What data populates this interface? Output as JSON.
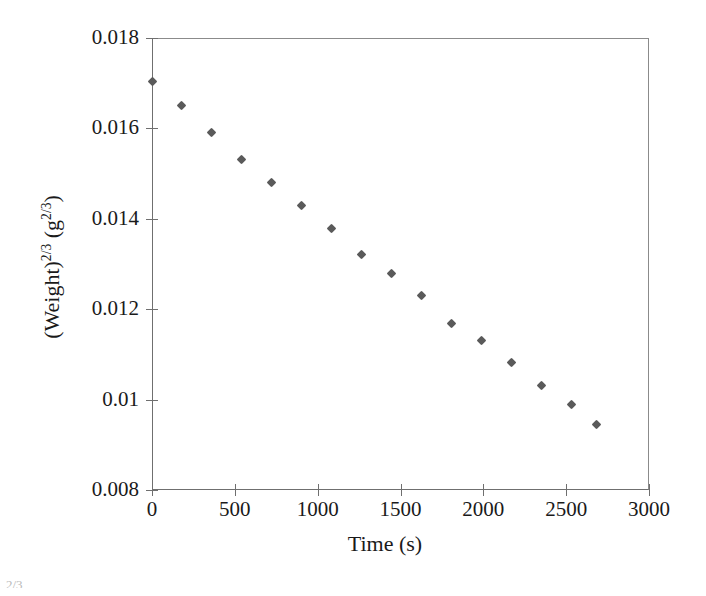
{
  "chart_data": {
    "type": "scatter",
    "title": "",
    "xlabel": "Time (s)",
    "ylabel": "(Weight)2/3 (g2/3)",
    "ylabel_parts": {
      "base1": "(Weight)",
      "exp1": "2/3",
      "mid": " (g",
      "exp2": "2/3",
      "tail": ")"
    },
    "xlim": [
      0,
      3000
    ],
    "ylim": [
      0.008,
      0.018
    ],
    "xticks": [
      0,
      500,
      1000,
      1500,
      2000,
      2500,
      3000
    ],
    "yticks": [
      0.008,
      0.01,
      0.012,
      0.014,
      0.016,
      0.018
    ],
    "xtick_labels": [
      "0",
      "500",
      "1000",
      "1500",
      "2000",
      "2500",
      "3000"
    ],
    "ytick_labels": [
      "0.008",
      "0.01",
      "0.012",
      "0.014",
      "0.016",
      "0.018"
    ],
    "grid": false,
    "legend": null,
    "marker": "diamond",
    "marker_color": "#5a5a5a",
    "frame_color": "#6f6f6f",
    "x": [
      0,
      181,
      362,
      543,
      724,
      905,
      1086,
      1267,
      1448,
      1629,
      1810,
      1991,
      2172,
      2353,
      2534,
      2685
    ],
    "y": [
      0.01703,
      0.01651,
      0.0159,
      0.01531,
      0.0148,
      0.01429,
      0.01379,
      0.01321,
      0.0128,
      0.0123,
      0.01169,
      0.0113,
      0.01081,
      0.01032,
      0.0099,
      0.00944
    ],
    "points": [
      {
        "x": 0,
        "y": 0.01703
      },
      {
        "x": 181,
        "y": 0.01651
      },
      {
        "x": 362,
        "y": 0.0159
      },
      {
        "x": 543,
        "y": 0.01531
      },
      {
        "x": 724,
        "y": 0.0148
      },
      {
        "x": 905,
        "y": 0.01429
      },
      {
        "x": 1086,
        "y": 0.01379
      },
      {
        "x": 1267,
        "y": 0.01321
      },
      {
        "x": 1448,
        "y": 0.0128
      },
      {
        "x": 1629,
        "y": 0.0123
      },
      {
        "x": 1810,
        "y": 0.01169
      },
      {
        "x": 1991,
        "y": 0.0113
      },
      {
        "x": 2172,
        "y": 0.01081
      },
      {
        "x": 2353,
        "y": 0.01032
      },
      {
        "x": 2534,
        "y": 0.0099
      },
      {
        "x": 2685,
        "y": 0.00944
      }
    ]
  },
  "artifact": {
    "text": "2/3"
  }
}
